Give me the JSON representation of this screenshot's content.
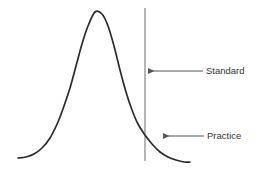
{
  "figure": {
    "background_color": "#ffffff",
    "curve_color": "#2b2b2b",
    "reference_line_color": "#a3a3a3",
    "annotation_color": "#555555",
    "label_color": "#333333"
  },
  "annotations": {
    "standard": {
      "label": "Standard",
      "arrow_tip_x": 148,
      "arrow_tip_y": 71,
      "arrow_tail_x": 203,
      "label_x": 206,
      "label_y": 71
    },
    "practice": {
      "label": "Practice",
      "arrow_tip_x": 163,
      "arrow_tip_y": 136,
      "arrow_tail_x": 204,
      "label_x": 207,
      "label_y": 136
    }
  },
  "reference_line": {
    "name": "standard-threshold-line",
    "x": 145,
    "y_top": 8,
    "y_bottom": 161
  },
  "chart_data": {
    "type": "line",
    "title": "",
    "xlabel": "",
    "ylabel": "",
    "grid": false,
    "legend_position": "right-annotations",
    "xlim": [
      0,
      260
    ],
    "ylim": [
      174,
      0
    ],
    "peak": {
      "x": 95,
      "y": 12
    },
    "curve_points": [
      [
        18,
        158
      ],
      [
        26,
        157
      ],
      [
        34,
        154
      ],
      [
        42,
        148
      ],
      [
        50,
        138
      ],
      [
        58,
        122
      ],
      [
        64,
        106
      ],
      [
        70,
        88
      ],
      [
        76,
        66
      ],
      [
        82,
        44
      ],
      [
        88,
        26
      ],
      [
        95,
        12
      ],
      [
        102,
        14
      ],
      [
        108,
        26
      ],
      [
        114,
        46
      ],
      [
        120,
        70
      ],
      [
        126,
        92
      ],
      [
        132,
        110
      ],
      [
        138,
        124
      ],
      [
        145,
        135
      ],
      [
        152,
        144
      ],
      [
        160,
        152
      ],
      [
        168,
        157
      ],
      [
        176,
        160
      ],
      [
        184,
        162
      ],
      [
        190,
        162
      ]
    ],
    "series": [
      {
        "name": "distribution",
        "color": "#2b2b2b"
      }
    ],
    "markers": [
      {
        "name": "Standard",
        "type": "vline",
        "x": 145
      },
      {
        "name": "Practice",
        "type": "tail-annotation",
        "x": 168
      }
    ]
  }
}
